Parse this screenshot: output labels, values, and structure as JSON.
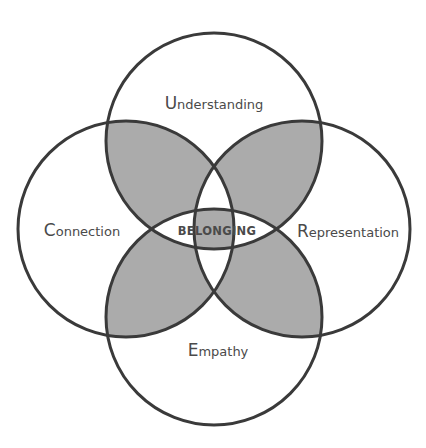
{
  "diagram": {
    "type": "four-circle venn",
    "center_label": "BELONGING",
    "circles": [
      {
        "id": "top",
        "cap": "U",
        "rest": "nderstanding",
        "label": "Understanding"
      },
      {
        "id": "left",
        "cap": "C",
        "rest": "onnection",
        "label": "Connection"
      },
      {
        "id": "right",
        "cap": "R",
        "rest": "epresentation",
        "label": "Representation"
      },
      {
        "id": "bottom",
        "cap": "E",
        "rest": "mpathy",
        "label": "Empathy"
      }
    ],
    "colors": {
      "stroke": "#3a3a3a",
      "shade": "#ababab",
      "text": "#4a4a4a",
      "background": "#ffffff"
    }
  }
}
